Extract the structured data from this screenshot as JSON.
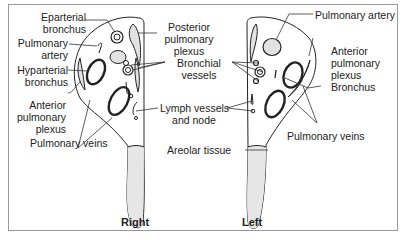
{
  "labels": {
    "eparterial_bronchus": [
      "Eparterial",
      "bronchus"
    ],
    "pulmonary_artery_right": [
      "Pulmonary",
      "artery"
    ],
    "hyparterial_bronchus": [
      "Hyparterial",
      "bronchus"
    ],
    "anterior_plexus_right": [
      "Anterior",
      "pulmonary",
      "plexus"
    ],
    "pulmonary_veins_right": "Pulmonary veins",
    "posterior_plexus": [
      "Posterior",
      "pulmonary",
      "plexus"
    ],
    "bronchial_vessels": [
      "Bronchial",
      "vessels"
    ],
    "lymph_vessels": [
      "Lymph vessels",
      "and node"
    ],
    "areolar_tissue": "Areolar tissue",
    "pulmonary_artery_left": "Pulmonary artery",
    "anterior_plexus_left": [
      "Anterior",
      "pulmonary",
      "plexus"
    ],
    "bronchus_left": "Bronchus",
    "pulmonary_veins_left": "Pulmonary veins",
    "right": "Right",
    "left": "Left"
  },
  "colors": {
    "line": "#222222",
    "border": "#9a9a9a",
    "areolar": "#e6e6e6",
    "vessel_fill": "#e2e2e2"
  }
}
